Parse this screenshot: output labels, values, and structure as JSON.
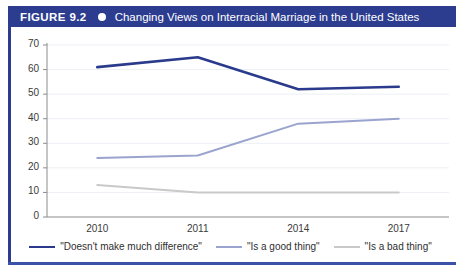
{
  "figure": {
    "number_label": "FIGURE 9.2",
    "bullet_icon": "circle-bullet-icon",
    "title": "Changing Views on Interracial Marriage in the United States",
    "header_bg": "#2c3c8f",
    "header_text_color": "#ffffff",
    "rail_color": "#3a52a8"
  },
  "chart_data": {
    "type": "line",
    "title": "Changing Views on Interracial Marriage in the United States",
    "xlabel": "",
    "ylabel": "",
    "categories": [
      "2010",
      "2011",
      "2014",
      "2017"
    ],
    "series": [
      {
        "name": "\"Doesn't make much difference\"",
        "color": "#2a3a8c",
        "values": [
          61,
          65,
          52,
          53
        ]
      },
      {
        "name": "\"Is a good thing\"",
        "color": "#9aa4cf",
        "values": [
          24,
          25,
          38,
          40
        ]
      },
      {
        "name": "\"Is a bad thing\"",
        "color": "#c9c9c9",
        "values": [
          13,
          10,
          10,
          10
        ]
      }
    ],
    "ylim": [
      0,
      70
    ],
    "yticks": [
      0,
      10,
      20,
      30,
      40,
      50,
      60,
      70
    ],
    "ytick_labels": [
      "0",
      "10",
      "20",
      "30",
      "40",
      "50",
      "60",
      "70"
    ],
    "grid": true,
    "grid_color": "#eceff5",
    "legend_position": "bottom",
    "axis_color": "#8c8c8c"
  },
  "legend": {
    "items": [
      {
        "label": "\"Doesn't make much difference\"",
        "color": "#2a3a8c",
        "width": "2.6px"
      },
      {
        "label": "\"Is a good thing\"",
        "color": "#9aa4cf",
        "width": "2px"
      },
      {
        "label": "\"Is a bad thing\"",
        "color": "#c9c9c9",
        "width": "2px"
      }
    ]
  }
}
